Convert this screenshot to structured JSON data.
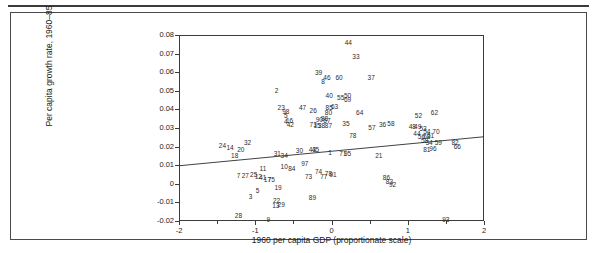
{
  "figure": {
    "title": "",
    "axis_label_x": "1960 per capita GDP (proportionate scale)",
    "axis_label_y": "Per capita growth rate, 1960–85"
  },
  "chart_data": {
    "type": "scatter",
    "title": "",
    "xlabel": "1960 per capita GDP (proportionate scale)",
    "ylabel": "Per capita growth rate, 1960–85",
    "xlim": [
      -2,
      2
    ],
    "ylim": [
      -0.02,
      0.08
    ],
    "grid": false,
    "legend": false,
    "xticks": [
      "-2",
      "-1",
      "0",
      "1",
      "2"
    ],
    "xtick_values": [
      -2,
      -1,
      0,
      1,
      2
    ],
    "xminor_values": [
      -1.5,
      -0.5,
      0.5,
      1.5
    ],
    "yticks": [
      "0.08",
      "0.07",
      "0.06",
      "0.05",
      "0.04",
      "0.03",
      "0.02",
      "0.01",
      "0",
      "-0.01",
      "-0.02"
    ],
    "ytick_values": [
      0.08,
      0.07,
      0.06,
      0.05,
      0.04,
      0.03,
      0.02,
      0.01,
      0,
      -0.01,
      -0.02
    ],
    "marker_style": "numeric-label",
    "fit_line": {
      "x1": -2,
      "y1": 0.0097,
      "x2": 2,
      "y2": 0.0253,
      "color": "#2b2b2b"
    },
    "points": [
      {
        "label": "2",
        "x": -0.72,
        "y": 0.05
      },
      {
        "label": "39",
        "x": -0.17,
        "y": 0.0595
      },
      {
        "label": "44",
        "x": 0.22,
        "y": 0.0755
      },
      {
        "label": "33",
        "x": 0.32,
        "y": 0.068
      },
      {
        "label": "46",
        "x": -0.06,
        "y": 0.057
      },
      {
        "label": "8",
        "x": -0.11,
        "y": 0.0548
      },
      {
        "label": "60",
        "x": 0.1,
        "y": 0.057
      },
      {
        "label": "37",
        "x": 0.52,
        "y": 0.0568
      },
      {
        "label": "23",
        "x": -0.66,
        "y": 0.0405
      },
      {
        "label": "98",
        "x": -0.6,
        "y": 0.0385
      },
      {
        "label": "5",
        "x": -0.6,
        "y": 0.0362
      },
      {
        "label": "4",
        "x": -0.6,
        "y": 0.033
      },
      {
        "label": "16",
        "x": -0.55,
        "y": 0.0338
      },
      {
        "label": "42",
        "x": -0.54,
        "y": 0.0315
      },
      {
        "label": "47",
        "x": -0.38,
        "y": 0.0405
      },
      {
        "label": "40",
        "x": -0.03,
        "y": 0.0472
      },
      {
        "label": "55",
        "x": 0.12,
        "y": 0.046
      },
      {
        "label": "50",
        "x": 0.21,
        "y": 0.0472
      },
      {
        "label": "69",
        "x": 0.21,
        "y": 0.0448
      },
      {
        "label": "26",
        "x": -0.24,
        "y": 0.0392
      },
      {
        "label": "85",
        "x": -0.03,
        "y": 0.0405
      },
      {
        "label": "63",
        "x": 0.04,
        "y": 0.0412
      },
      {
        "label": "80",
        "x": -0.04,
        "y": 0.038
      },
      {
        "label": "64",
        "x": 0.37,
        "y": 0.0378
      },
      {
        "label": "52",
        "x": 1.14,
        "y": 0.0362
      },
      {
        "label": "62",
        "x": 1.35,
        "y": 0.038
      },
      {
        "label": "90",
        "x": -0.16,
        "y": 0.0342
      },
      {
        "label": "88",
        "x": -0.09,
        "y": 0.0348
      },
      {
        "label": "67",
        "x": -0.06,
        "y": 0.0335
      },
      {
        "label": "35",
        "x": 0.19,
        "y": 0.0322
      },
      {
        "label": "57",
        "x": 0.53,
        "y": 0.03
      },
      {
        "label": "36",
        "x": 0.67,
        "y": 0.0318
      },
      {
        "label": "58",
        "x": 0.78,
        "y": 0.032
      },
      {
        "label": "48",
        "x": 1.06,
        "y": 0.0308
      },
      {
        "label": "49",
        "x": 1.13,
        "y": 0.0308
      },
      {
        "label": "53",
        "x": 1.2,
        "y": 0.0292
      },
      {
        "label": "73",
        "x": -0.24,
        "y": 0.0315
      },
      {
        "label": "15",
        "x": -0.19,
        "y": 0.0312
      },
      {
        "label": "38",
        "x": -0.13,
        "y": 0.0312
      },
      {
        "label": "87",
        "x": -0.04,
        "y": 0.031
      },
      {
        "label": "44b",
        "x": 1.12,
        "y": 0.027
      },
      {
        "label": "54",
        "x": 1.25,
        "y": 0.0278
      },
      {
        "label": "70",
        "x": 1.37,
        "y": 0.0278
      },
      {
        "label": "56",
        "x": 1.18,
        "y": 0.0252
      },
      {
        "label": "68",
        "x": 1.25,
        "y": 0.0252
      },
      {
        "label": "51",
        "x": 1.3,
        "y": 0.0255
      },
      {
        "label": "78",
        "x": 0.28,
        "y": 0.0258
      },
      {
        "label": "24",
        "x": -1.43,
        "y": 0.0205
      },
      {
        "label": "14",
        "x": -1.33,
        "y": 0.0195
      },
      {
        "label": "32",
        "x": -1.1,
        "y": 0.0218
      },
      {
        "label": "20",
        "x": -1.19,
        "y": 0.0182
      },
      {
        "label": "18",
        "x": -1.27,
        "y": 0.0148
      },
      {
        "label": "31",
        "x": -0.71,
        "y": 0.0162
      },
      {
        "label": "34",
        "x": -0.62,
        "y": 0.015
      },
      {
        "label": "30",
        "x": -0.42,
        "y": 0.0175
      },
      {
        "label": "43",
        "x": -0.25,
        "y": 0.0182
      },
      {
        "label": "45",
        "x": -0.21,
        "y": 0.018
      },
      {
        "label": "1",
        "x": -0.02,
        "y": 0.0168
      },
      {
        "label": "71",
        "x": 0.15,
        "y": 0.016
      },
      {
        "label": "95",
        "x": 0.21,
        "y": 0.0162
      },
      {
        "label": "58b",
        "x": 1.22,
        "y": 0.0228
      },
      {
        "label": "34b",
        "x": 1.28,
        "y": 0.0222
      },
      {
        "label": "59",
        "x": 1.4,
        "y": 0.0222
      },
      {
        "label": "82",
        "x": 1.62,
        "y": 0.0222
      },
      {
        "label": "66",
        "x": 1.65,
        "y": 0.02
      },
      {
        "label": "81",
        "x": 1.25,
        "y": 0.0182
      },
      {
        "label": "96",
        "x": 1.33,
        "y": 0.0185
      },
      {
        "label": "21",
        "x": 0.62,
        "y": 0.0152
      },
      {
        "label": "97",
        "x": -0.35,
        "y": 0.0108
      },
      {
        "label": "10",
        "x": -0.62,
        "y": 0.0088
      },
      {
        "label": "84",
        "x": -0.52,
        "y": 0.0082
      },
      {
        "label": "11",
        "x": -0.9,
        "y": 0.0078
      },
      {
        "label": "25",
        "x": -1.02,
        "y": 0.005
      },
      {
        "label": "12",
        "x": -0.96,
        "y": 0.0035
      },
      {
        "label": "41",
        "x": -0.9,
        "y": 0.003
      },
      {
        "label": "17",
        "x": -0.84,
        "y": 0.0022
      },
      {
        "label": "75",
        "x": -0.79,
        "y": 0.0022
      },
      {
        "label": "7",
        "x": -1.22,
        "y": 0.004
      },
      {
        "label": "27",
        "x": -1.13,
        "y": 0.004
      },
      {
        "label": "74",
        "x": -0.17,
        "y": 0.0062
      },
      {
        "label": "77",
        "x": -0.1,
        "y": 0.0038
      },
      {
        "label": "78b",
        "x": -0.04,
        "y": 0.0052
      },
      {
        "label": "91",
        "x": 0.02,
        "y": 0.0045
      },
      {
        "label": "73b",
        "x": -0.3,
        "y": 0.0035
      },
      {
        "label": "86",
        "x": 0.72,
        "y": 0.003
      },
      {
        "label": "83",
        "x": 0.76,
        "y": 0.0008
      },
      {
        "label": "92",
        "x": 0.8,
        "y": -0.0008
      },
      {
        "label": "19",
        "x": -0.7,
        "y": -0.002
      },
      {
        "label": "5b",
        "x": -0.97,
        "y": -0.004
      },
      {
        "label": "3",
        "x": -1.06,
        "y": -0.007
      },
      {
        "label": "89",
        "x": -0.25,
        "y": -0.0075
      },
      {
        "label": "22",
        "x": -0.72,
        "y": -0.0092
      },
      {
        "label": "13",
        "x": -0.73,
        "y": -0.0118
      },
      {
        "label": "29",
        "x": -0.66,
        "y": -0.0112
      },
      {
        "label": "28",
        "x": -1.22,
        "y": -0.0172
      },
      {
        "label": "9",
        "x": -0.83,
        "y": -0.0195
      },
      {
        "label": "93",
        "x": 1.5,
        "y": -0.0192
      }
    ]
  }
}
